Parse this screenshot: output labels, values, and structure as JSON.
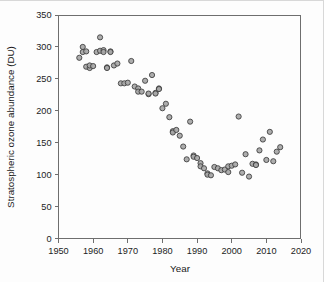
{
  "figure": {
    "background_color": "#fdfdfd",
    "marker_fill_color": "#a6a6a6",
    "marker_edge_color": "#3b3b3b",
    "axis_color": "#6e6e6e",
    "caption_partial": ""
  },
  "chart_data": {
    "type": "scatter",
    "title": "",
    "xlabel": "Year",
    "ylabel": "Stratospheric ozone abundance (DU)",
    "xlim": [
      1950,
      2020
    ],
    "ylim": [
      0,
      350
    ],
    "xticks": [
      1950,
      1960,
      1970,
      1980,
      1990,
      2000,
      2010,
      2020
    ],
    "yticks": [
      0,
      50,
      100,
      150,
      200,
      250,
      300,
      350
    ],
    "xtick_labels": [
      "1950",
      "1960",
      "1970",
      "1980",
      "1990",
      "2000",
      "2010",
      "2020"
    ],
    "ytick_labels": [
      "0",
      "50",
      "100",
      "150",
      "200",
      "250",
      "300",
      "350"
    ],
    "grid": false,
    "legend": null,
    "series": [
      {
        "name": "Stratospheric ozone abundance",
        "marker": "circle",
        "points": [
          [
            1956,
            283
          ],
          [
            1957,
            300
          ],
          [
            1957,
            292
          ],
          [
            1958,
            293
          ],
          [
            1958,
            269
          ],
          [
            1959,
            267
          ],
          [
            1959,
            271
          ],
          [
            1960,
            270
          ],
          [
            1961,
            292
          ],
          [
            1962,
            315
          ],
          [
            1962,
            294
          ],
          [
            1963,
            295
          ],
          [
            1963,
            292
          ],
          [
            1964,
            268
          ],
          [
            1964,
            267
          ],
          [
            1965,
            293
          ],
          [
            1965,
            292
          ],
          [
            1966,
            271
          ],
          [
            1967,
            274
          ],
          [
            1968,
            243
          ],
          [
            1969,
            243
          ],
          [
            1970,
            244
          ],
          [
            1971,
            278
          ],
          [
            1972,
            238
          ],
          [
            1973,
            235
          ],
          [
            1973,
            230
          ],
          [
            1974,
            230
          ],
          [
            1975,
            247
          ],
          [
            1976,
            226
          ],
          [
            1976,
            227
          ],
          [
            1977,
            256
          ],
          [
            1978,
            228
          ],
          [
            1978,
            227
          ],
          [
            1979,
            235
          ],
          [
            1979,
            234
          ],
          [
            1980,
            204
          ],
          [
            1981,
            211
          ],
          [
            1982,
            190
          ],
          [
            1983,
            168
          ],
          [
            1983,
            166
          ],
          [
            1984,
            170
          ],
          [
            1985,
            161
          ],
          [
            1986,
            144
          ],
          [
            1987,
            124
          ],
          [
            1988,
            183
          ],
          [
            1989,
            130
          ],
          [
            1989,
            128
          ],
          [
            1990,
            126
          ],
          [
            1991,
            118
          ],
          [
            1991,
            113
          ],
          [
            1992,
            110
          ],
          [
            1993,
            102
          ],
          [
            1993,
            100
          ],
          [
            1994,
            99
          ],
          [
            1995,
            112
          ],
          [
            1996,
            110
          ],
          [
            1997,
            107
          ],
          [
            1998,
            108
          ],
          [
            1999,
            104
          ],
          [
            1999,
            113
          ],
          [
            2000,
            114
          ],
          [
            2001,
            116
          ],
          [
            2002,
            191
          ],
          [
            2003,
            103
          ],
          [
            2004,
            132
          ],
          [
            2005,
            97
          ],
          [
            2006,
            117
          ],
          [
            2007,
            116
          ],
          [
            2007,
            115
          ],
          [
            2008,
            138
          ],
          [
            2009,
            155
          ],
          [
            2010,
            123
          ],
          [
            2011,
            167
          ],
          [
            2012,
            121
          ],
          [
            2013,
            136
          ],
          [
            2014,
            143
          ]
        ]
      }
    ]
  }
}
